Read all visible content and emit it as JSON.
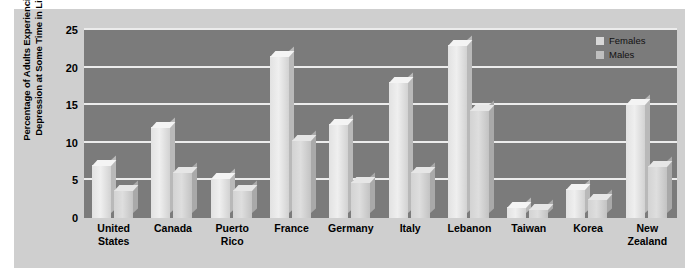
{
  "chart_data": {
    "type": "bar",
    "title": "",
    "xlabel": "",
    "ylabel": "Percentage of Adults Experiencing Depression at Some Time in Life",
    "ylim": [
      0,
      25
    ],
    "yticks": [
      0,
      5,
      10,
      15,
      20,
      25
    ],
    "ytick_labels": [
      "0",
      "5",
      "10",
      "15",
      "20",
      "25"
    ],
    "grid": true,
    "legend_position": "top-right",
    "categories": [
      "United States",
      "Canada",
      "Puerto Rico",
      "France",
      "Germany",
      "Italy",
      "Lebanon",
      "Taiwan",
      "Korea",
      "New Zealand"
    ],
    "category_lines": [
      [
        "United",
        "States"
      ],
      [
        "Canada"
      ],
      [
        "Puerto",
        "Rico"
      ],
      [
        "France"
      ],
      [
        "Germany"
      ],
      [
        "Italy"
      ],
      [
        "Lebanon"
      ],
      [
        "Taiwan"
      ],
      [
        "Korea"
      ],
      [
        "New",
        "Zealand"
      ]
    ],
    "series": [
      {
        "name": "Females",
        "color": "#e8e8e8",
        "values": [
          7.0,
          12.1,
          5.3,
          21.5,
          12.5,
          18.1,
          23.0,
          1.5,
          3.8,
          15.2
        ]
      },
      {
        "name": "Males",
        "color": "#d0d0d0",
        "values": [
          3.7,
          6.1,
          3.7,
          10.4,
          4.8,
          6.1,
          14.4,
          1.2,
          2.5,
          6.9
        ]
      }
    ]
  },
  "legend": {
    "items": [
      {
        "label": "Females",
        "swatch": "females"
      },
      {
        "label": "Males",
        "swatch": "males"
      }
    ]
  },
  "colors": {
    "plot_background": "#7b7b7b",
    "figure_background": "#cfcfcf",
    "gridline": "#ececec",
    "females_bar": "#e8e8e8",
    "males_bar": "#d0d0d0",
    "text": "#000000"
  }
}
